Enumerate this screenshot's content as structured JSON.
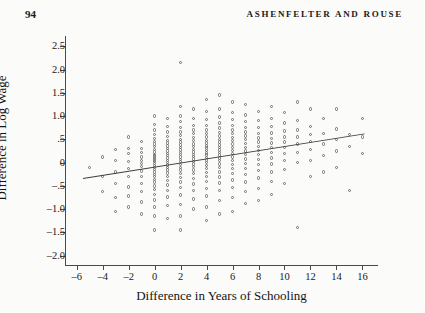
{
  "page": {
    "folio": "94",
    "running_head": "ASHENFELTER AND ROUSE"
  },
  "figure": {
    "xlabel": "Difference in Years of Schooling",
    "ylabel": "Difference in Log Wage"
  },
  "chart_data": {
    "type": "scatter",
    "title": "",
    "xlabel": "Difference in Years of Schooling",
    "ylabel": "Difference in Log Wage",
    "xlim": [
      -6.9,
      17.2
    ],
    "ylim": [
      -2.2,
      2.72
    ],
    "xticks": [
      -6,
      -4,
      -2,
      0,
      2,
      4,
      6,
      8,
      10,
      12,
      14,
      16
    ],
    "xticklabels": [
      "–6",
      "–4",
      "–2",
      "0",
      "2",
      "4",
      "6",
      "8",
      "10",
      "12",
      "14",
      "16"
    ],
    "yticks": [
      -2.0,
      -1.5,
      -1.0,
      -0.5,
      0,
      0.5,
      1.0,
      1.5,
      2.0,
      2.5
    ],
    "yticklabels": [
      "–2.0",
      "–1.5",
      "–1.0",
      "–.5",
      "0",
      ".5",
      "1.0",
      "1.5",
      "2.0",
      "2.5"
    ],
    "grid": false,
    "legend": false,
    "marker": "open-circle",
    "marker_color": "#6e6e6e",
    "line_color": "#3b3b3b",
    "trendline": {
      "type": "linear",
      "x": [
        -5.5,
        16.2
      ],
      "y": [
        -0.33,
        0.63
      ],
      "slope": 0.0442,
      "intercept": -0.0868
    },
    "points": [
      [
        -5,
        -0.1
      ],
      [
        -4,
        0.12
      ],
      [
        -4,
        -0.3
      ],
      [
        -4,
        -0.62
      ],
      [
        -3,
        0.28
      ],
      [
        -3,
        0.05
      ],
      [
        -3,
        -0.2
      ],
      [
        -3,
        -0.45
      ],
      [
        -3,
        -0.75
      ],
      [
        -3,
        -1.05
      ],
      [
        -2,
        0.55
      ],
      [
        -2,
        0.3
      ],
      [
        -2,
        0.2
      ],
      [
        -2,
        0.02
      ],
      [
        -2,
        -0.12
      ],
      [
        -2,
        -0.3
      ],
      [
        -2,
        -0.52
      ],
      [
        -2,
        -0.72
      ],
      [
        -2,
        -0.95
      ],
      [
        -1,
        0.45
      ],
      [
        -1,
        0.3
      ],
      [
        -1,
        0.22
      ],
      [
        -1,
        0.12
      ],
      [
        -1,
        0.05
      ],
      [
        -1,
        -0.02
      ],
      [
        -1,
        -0.08
      ],
      [
        -1,
        -0.18
      ],
      [
        -1,
        -0.3
      ],
      [
        -1,
        -0.45
      ],
      [
        -1,
        -0.62
      ],
      [
        -1,
        -0.85
      ],
      [
        -1,
        -1.1
      ],
      [
        0,
        1.0
      ],
      [
        0,
        0.82
      ],
      [
        0,
        0.7
      ],
      [
        0,
        0.6
      ],
      [
        0,
        0.52
      ],
      [
        0,
        0.45
      ],
      [
        0,
        0.4
      ],
      [
        0,
        0.34
      ],
      [
        0,
        0.28
      ],
      [
        0,
        0.23
      ],
      [
        0,
        0.18
      ],
      [
        0,
        0.14
      ],
      [
        0,
        0.1
      ],
      [
        0,
        0.06
      ],
      [
        0,
        0.02
      ],
      [
        0,
        -0.02
      ],
      [
        0,
        -0.06
      ],
      [
        0,
        -0.1
      ],
      [
        0,
        -0.15
      ],
      [
        0,
        -0.2
      ],
      [
        0,
        -0.25
      ],
      [
        0,
        -0.3
      ],
      [
        0,
        -0.36
      ],
      [
        0,
        -0.42
      ],
      [
        0,
        -0.5
      ],
      [
        0,
        -0.58
      ],
      [
        0,
        -0.68
      ],
      [
        0,
        -0.8
      ],
      [
        0,
        -0.95
      ],
      [
        0,
        -1.15
      ],
      [
        0,
        -1.45
      ],
      [
        1,
        0.95
      ],
      [
        1,
        0.78
      ],
      [
        1,
        0.66
      ],
      [
        1,
        0.56
      ],
      [
        1,
        0.48
      ],
      [
        1,
        0.42
      ],
      [
        1,
        0.36
      ],
      [
        1,
        0.3
      ],
      [
        1,
        0.25
      ],
      [
        1,
        0.2
      ],
      [
        1,
        0.15
      ],
      [
        1,
        0.1
      ],
      [
        1,
        0.05
      ],
      [
        1,
        0.0
      ],
      [
        1,
        -0.05
      ],
      [
        1,
        -0.1
      ],
      [
        1,
        -0.16
      ],
      [
        1,
        -0.22
      ],
      [
        1,
        -0.3
      ],
      [
        1,
        -0.38
      ],
      [
        1,
        -0.48
      ],
      [
        1,
        -0.6
      ],
      [
        1,
        -0.74
      ],
      [
        1,
        -0.92
      ],
      [
        1,
        -1.2
      ],
      [
        2,
        2.15
      ],
      [
        2,
        1.2
      ],
      [
        2,
        1.0
      ],
      [
        2,
        0.88
      ],
      [
        2,
        0.76
      ],
      [
        2,
        0.66
      ],
      [
        2,
        0.58
      ],
      [
        2,
        0.5
      ],
      [
        2,
        0.44
      ],
      [
        2,
        0.38
      ],
      [
        2,
        0.32
      ],
      [
        2,
        0.27
      ],
      [
        2,
        0.22
      ],
      [
        2,
        0.17
      ],
      [
        2,
        0.12
      ],
      [
        2,
        0.07
      ],
      [
        2,
        0.02
      ],
      [
        2,
        -0.04
      ],
      [
        2,
        -0.1
      ],
      [
        2,
        -0.16
      ],
      [
        2,
        -0.24
      ],
      [
        2,
        -0.32
      ],
      [
        2,
        -0.42
      ],
      [
        2,
        -0.54
      ],
      [
        2,
        -0.7
      ],
      [
        2,
        -0.9
      ],
      [
        2,
        -1.15
      ],
      [
        2,
        -1.45
      ],
      [
        3,
        1.15
      ],
      [
        3,
        0.95
      ],
      [
        3,
        0.8
      ],
      [
        3,
        0.7
      ],
      [
        3,
        0.62
      ],
      [
        3,
        0.54
      ],
      [
        3,
        0.47
      ],
      [
        3,
        0.4
      ],
      [
        3,
        0.34
      ],
      [
        3,
        0.28
      ],
      [
        3,
        0.23
      ],
      [
        3,
        0.18
      ],
      [
        3,
        0.13
      ],
      [
        3,
        0.08
      ],
      [
        3,
        0.03
      ],
      [
        3,
        -0.03
      ],
      [
        3,
        -0.09
      ],
      [
        3,
        -0.16
      ],
      [
        3,
        -0.24
      ],
      [
        3,
        -0.34
      ],
      [
        3,
        -0.46
      ],
      [
        3,
        -0.6
      ],
      [
        3,
        -0.78
      ],
      [
        3,
        -1.0
      ],
      [
        4,
        1.35
      ],
      [
        4,
        1.1
      ],
      [
        4,
        0.92
      ],
      [
        4,
        0.8
      ],
      [
        4,
        0.7
      ],
      [
        4,
        0.62
      ],
      [
        4,
        0.55
      ],
      [
        4,
        0.48
      ],
      [
        4,
        0.42
      ],
      [
        4,
        0.36
      ],
      [
        4,
        0.31
      ],
      [
        4,
        0.26
      ],
      [
        4,
        0.21
      ],
      [
        4,
        0.16
      ],
      [
        4,
        0.11
      ],
      [
        4,
        0.06
      ],
      [
        4,
        0.0
      ],
      [
        4,
        -0.06
      ],
      [
        4,
        -0.13
      ],
      [
        4,
        -0.21
      ],
      [
        4,
        -0.3
      ],
      [
        4,
        -0.41
      ],
      [
        4,
        -0.55
      ],
      [
        4,
        -0.72
      ],
      [
        4,
        -0.95
      ],
      [
        4,
        -1.25
      ],
      [
        5,
        1.45
      ],
      [
        5,
        1.15
      ],
      [
        5,
        0.98
      ],
      [
        5,
        0.85
      ],
      [
        5,
        0.74
      ],
      [
        5,
        0.65
      ],
      [
        5,
        0.57
      ],
      [
        5,
        0.5
      ],
      [
        5,
        0.44
      ],
      [
        5,
        0.38
      ],
      [
        5,
        0.32
      ],
      [
        5,
        0.27
      ],
      [
        5,
        0.22
      ],
      [
        5,
        0.16
      ],
      [
        5,
        0.1
      ],
      [
        5,
        0.04
      ],
      [
        5,
        -0.03
      ],
      [
        5,
        -0.11
      ],
      [
        5,
        -0.2
      ],
      [
        5,
        -0.31
      ],
      [
        5,
        -0.44
      ],
      [
        5,
        -0.6
      ],
      [
        5,
        -0.82
      ],
      [
        5,
        -1.1
      ],
      [
        6,
        1.3
      ],
      [
        6,
        1.08
      ],
      [
        6,
        0.92
      ],
      [
        6,
        0.8
      ],
      [
        6,
        0.7
      ],
      [
        6,
        0.62
      ],
      [
        6,
        0.54
      ],
      [
        6,
        0.47
      ],
      [
        6,
        0.4
      ],
      [
        6,
        0.33
      ],
      [
        6,
        0.26
      ],
      [
        6,
        0.19
      ],
      [
        6,
        0.12
      ],
      [
        6,
        0.04
      ],
      [
        6,
        -0.04
      ],
      [
        6,
        -0.13
      ],
      [
        6,
        -0.24
      ],
      [
        6,
        -0.37
      ],
      [
        6,
        -0.53
      ],
      [
        6,
        -0.75
      ],
      [
        6,
        -1.05
      ],
      [
        7,
        1.25
      ],
      [
        7,
        1.02
      ],
      [
        7,
        0.88
      ],
      [
        7,
        0.76
      ],
      [
        7,
        0.66
      ],
      [
        7,
        0.57
      ],
      [
        7,
        0.49
      ],
      [
        7,
        0.41
      ],
      [
        7,
        0.33
      ],
      [
        7,
        0.25
      ],
      [
        7,
        0.17
      ],
      [
        7,
        0.08
      ],
      [
        7,
        -0.02
      ],
      [
        7,
        -0.13
      ],
      [
        7,
        -0.26
      ],
      [
        7,
        -0.42
      ],
      [
        7,
        -0.62
      ],
      [
        7,
        -0.88
      ],
      [
        8,
        1.1
      ],
      [
        8,
        0.9
      ],
      [
        8,
        0.75
      ],
      [
        8,
        0.63
      ],
      [
        8,
        0.53
      ],
      [
        8,
        0.44
      ],
      [
        8,
        0.35
      ],
      [
        8,
        0.26
      ],
      [
        8,
        0.17
      ],
      [
        8,
        0.07
      ],
      [
        8,
        -0.04
      ],
      [
        8,
        -0.17
      ],
      [
        8,
        -0.33
      ],
      [
        8,
        -0.55
      ],
      [
        8,
        -0.82
      ],
      [
        9,
        1.2
      ],
      [
        9,
        0.95
      ],
      [
        9,
        0.78
      ],
      [
        9,
        0.64
      ],
      [
        9,
        0.52
      ],
      [
        9,
        0.42
      ],
      [
        9,
        0.32
      ],
      [
        9,
        0.22
      ],
      [
        9,
        0.1
      ],
      [
        9,
        -0.03
      ],
      [
        9,
        -0.2
      ],
      [
        9,
        -0.4
      ],
      [
        9,
        -0.68
      ],
      [
        10,
        1.08
      ],
      [
        10,
        0.85
      ],
      [
        10,
        0.68
      ],
      [
        10,
        0.55
      ],
      [
        10,
        0.44
      ],
      [
        10,
        0.33
      ],
      [
        10,
        0.2
      ],
      [
        10,
        0.05
      ],
      [
        10,
        -0.15
      ],
      [
        10,
        -0.45
      ],
      [
        11,
        1.3
      ],
      [
        11,
        0.9
      ],
      [
        11,
        0.7
      ],
      [
        11,
        0.55
      ],
      [
        11,
        0.4
      ],
      [
        11,
        0.22
      ],
      [
        11,
        0.0
      ],
      [
        11,
        -1.4
      ],
      [
        12,
        1.15
      ],
      [
        12,
        0.78
      ],
      [
        12,
        0.6
      ],
      [
        12,
        0.45
      ],
      [
        12,
        0.28
      ],
      [
        12,
        0.05
      ],
      [
        12,
        -0.3
      ],
      [
        13,
        0.95
      ],
      [
        13,
        0.62
      ],
      [
        13,
        0.4
      ],
      [
        13,
        0.15
      ],
      [
        13,
        -0.2
      ],
      [
        14,
        1.15
      ],
      [
        14,
        0.72
      ],
      [
        14,
        0.5
      ],
      [
        14,
        0.25
      ],
      [
        14,
        -0.1
      ],
      [
        15,
        0.6
      ],
      [
        15,
        0.35
      ],
      [
        15,
        -0.6
      ],
      [
        16,
        0.95
      ],
      [
        16,
        0.55
      ],
      [
        16,
        0.2
      ]
    ]
  }
}
